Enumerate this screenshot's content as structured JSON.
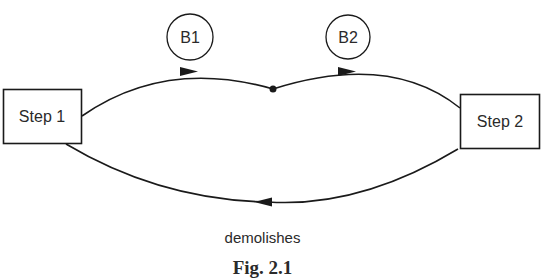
{
  "diagram": {
    "nodes": {
      "step1": {
        "label": "Step 1",
        "shape": "rectangle"
      },
      "step2": {
        "label": "Step 2",
        "shape": "rectangle"
      },
      "b1": {
        "label": "B1",
        "shape": "circle"
      },
      "b2": {
        "label": "B2",
        "shape": "circle"
      },
      "junction": {
        "label": "",
        "shape": "dot"
      }
    },
    "edges": [
      {
        "from": "step1",
        "to": "junction",
        "via_label": "B1",
        "direction": "right"
      },
      {
        "from": "junction",
        "to": "step2",
        "via_label": "B2",
        "direction": "right"
      },
      {
        "from": "step2",
        "to": "step1",
        "label": "demolishes",
        "direction": "left"
      }
    ],
    "edge_label": "demolishes",
    "caption": "Fig. 2.1"
  },
  "colors": {
    "stroke": "#1a1a1a",
    "text": "#2a2a2a",
    "background": "#ffffff"
  }
}
